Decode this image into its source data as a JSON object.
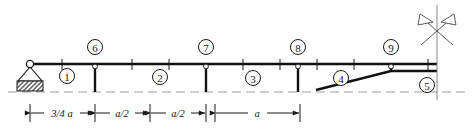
{
  "figure": {
    "type": "structural-beam-diagram",
    "stroke_color": "#1a1a1a",
    "dash_color": "#9a9a9a",
    "beam_color": "#111111"
  },
  "beam": {
    "y": 64,
    "x_start": 30,
    "x_end": 437,
    "thickness": 2.6
  },
  "baseline": {
    "label": "ground-reference-dashed-line",
    "y": 92,
    "x_start": 8,
    "x_end": 466
  },
  "support": {
    "name": "pin-support",
    "pin_x": 30,
    "pin_y": 64,
    "triangle_half_width": 12,
    "triangle_bottom_y": 81,
    "hatch_box": {
      "x": 17,
      "y": 81,
      "width": 26,
      "height": 10
    }
  },
  "ticks": {
    "label": "beam-division-ticks",
    "y_top": 59,
    "y_bottom": 70,
    "x_positions": [
      62,
      95,
      132,
      169,
      206,
      243,
      280,
      317,
      354,
      391,
      428
    ]
  },
  "columns": [
    {
      "name": "column-6",
      "x": 95,
      "y_top": 64,
      "y_bottom": 92
    },
    {
      "name": "column-7",
      "x": 206,
      "y_top": 64,
      "y_bottom": 92
    },
    {
      "name": "column-8",
      "x": 298,
      "y_top": 64,
      "y_bottom": 92
    },
    {
      "name": "column-9",
      "x": 391,
      "y_top": 64,
      "y_bottom": 72
    }
  ],
  "inclined_member": {
    "name": "inclined-bottom-chord",
    "x1": 316,
    "y1": 90,
    "x2": 391,
    "y2": 71,
    "x3": 437,
    "y3": 71
  },
  "nodes": [
    {
      "id": "node-6",
      "label": "6",
      "x": 95,
      "y": 47
    },
    {
      "id": "node-7",
      "label": "7",
      "x": 206,
      "y": 47
    },
    {
      "id": "node-8",
      "label": "8",
      "x": 298,
      "y": 47
    },
    {
      "id": "node-9",
      "label": "9",
      "x": 391,
      "y": 47
    }
  ],
  "spans": [
    {
      "id": "span-1",
      "label": "1",
      "x": 67,
      "y": 76
    },
    {
      "id": "span-2",
      "label": "2",
      "x": 160,
      "y": 77
    },
    {
      "id": "span-3",
      "label": "3",
      "x": 253,
      "y": 78
    },
    {
      "id": "span-4",
      "label": "4",
      "x": 341,
      "y": 78
    },
    {
      "id": "span-5",
      "label": "5",
      "x": 427,
      "y": 85
    }
  ],
  "node_circle_radius": 7.5,
  "span_circle_radius": 7.5,
  "symmetry_marker": {
    "name": "symmetry-axis-marker",
    "center_x": 437,
    "center_y": 30,
    "vertical_line": {
      "x": 437,
      "y_top": 5,
      "y_bottom": 100
    },
    "arm_length": 17,
    "flag_left_tip": {
      "x": 416,
      "y": 13
    },
    "flag_right_tip": {
      "x": 458,
      "y": 13
    }
  },
  "dimensions": {
    "line_y": 113,
    "extension_ticks_y_top": 104,
    "extension_ticks_y_bottom": 122,
    "items": [
      {
        "id": "dim-1",
        "label": "3/4 a",
        "x1": 30,
        "x2": 95,
        "label_x": 62
      },
      {
        "id": "dim-2",
        "label": "a/2",
        "x1": 95,
        "x2": 150,
        "label_x": 122
      },
      {
        "id": "dim-3",
        "label": "a/2",
        "x1": 150,
        "x2": 206,
        "label_x": 178
      },
      {
        "id": "dim-4",
        "label": "a",
        "x1": 215,
        "x2": 300,
        "label_x": 257
      }
    ]
  }
}
